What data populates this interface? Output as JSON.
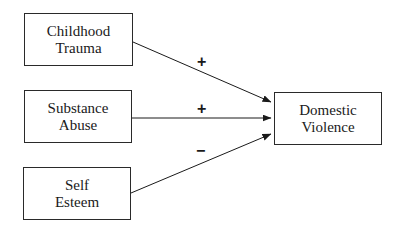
{
  "diagram": {
    "type": "path-model",
    "nodes": [
      {
        "id": "childhood_trauma",
        "lines": [
          "Childhood",
          "Trauma"
        ]
      },
      {
        "id": "substance_abuse",
        "lines": [
          "Substance",
          "Abuse"
        ]
      },
      {
        "id": "self_esteem",
        "lines": [
          "Self",
          "Esteem"
        ]
      },
      {
        "id": "domestic_violence",
        "lines": [
          "Domestic",
          "Violence"
        ]
      }
    ],
    "edges": [
      {
        "from": "childhood_trauma",
        "to": "domestic_violence",
        "sign": "+"
      },
      {
        "from": "substance_abuse",
        "to": "domestic_violence",
        "sign": "+"
      },
      {
        "from": "self_esteem",
        "to": "domestic_violence",
        "sign": "−"
      }
    ]
  }
}
